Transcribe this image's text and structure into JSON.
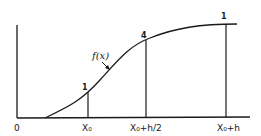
{
  "diagram": {
    "curve_label": "f(x)",
    "origin_label": "0",
    "x_labels": [
      "X₀",
      "X₀+h/2",
      "X₀+h"
    ],
    "weights": [
      "1",
      "4",
      "1"
    ],
    "colors": {
      "ink": "#1a1a1a",
      "background": "#ffffff"
    }
  }
}
